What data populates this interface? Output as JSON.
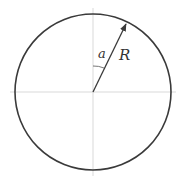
{
  "diagram": {
    "type": "circle-radius-angle",
    "labels": {
      "angle": "a",
      "radius": "R"
    },
    "geometry": {
      "center": [
        93,
        92
      ],
      "radius": 78,
      "arrow_tip": [
        127,
        22
      ]
    },
    "colors": {
      "stroke": "#3a3a3a",
      "axis": "#c8c8c8",
      "background": "#ffffff"
    }
  }
}
